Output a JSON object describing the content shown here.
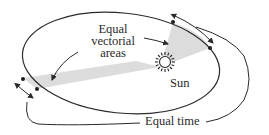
{
  "diagram": {
    "labels": {
      "areas_line1": "Equal",
      "areas_line2": "vectorial",
      "areas_line3": "areas",
      "sun": "Sun",
      "time": "Equal time"
    },
    "elements": {
      "orbit": "ellipse",
      "focus": "sun-icon",
      "sectors": [
        "perihelion-sector",
        "aphelion-sector"
      ],
      "arc_arrows": [
        "perihelion-arc-arrow",
        "aphelion-arc-arrow"
      ]
    },
    "colors": {
      "line": "#2a2a2a",
      "sector_fill": "#d9d9d9",
      "background": "#ffffff"
    }
  }
}
